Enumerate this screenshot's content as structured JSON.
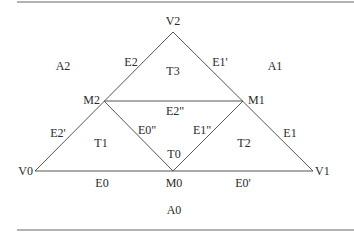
{
  "diagram": {
    "vertices": {
      "V0": "V0",
      "V1": "V1",
      "V2": "V2",
      "M0": "M0",
      "M1": "M1",
      "M2": "M2"
    },
    "edges": {
      "E0": "E0",
      "E0p": "E0'",
      "E0pp": "E0\"",
      "E1": "E1",
      "E1p": "E1'",
      "E1pp": "E1\"",
      "E2": "E2",
      "E2p": "E2'",
      "E2pp": "E2\""
    },
    "triangles": {
      "T0": "T0",
      "T1": "T1",
      "T2": "T2",
      "T3": "T3"
    },
    "regions": {
      "A0": "A0",
      "A1": "A1",
      "A2": "A2"
    }
  }
}
